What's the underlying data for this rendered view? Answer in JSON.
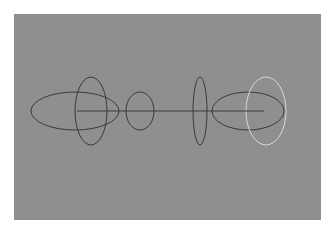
{
  "figure": {
    "background": "#ffffff",
    "panel_color": "#8f8f8f",
    "stroke_dark": "#3a3a3a",
    "stroke_light": "#d8d8d8",
    "axis_line": {
      "x1": 77,
      "x2": 264,
      "y": 111
    },
    "shapes": [
      {
        "name": "large-horizontal-ellipse",
        "cx": 75,
        "cy": 111,
        "rx": 44,
        "ry": 19,
        "tone": "dark"
      },
      {
        "name": "tall-ellipse",
        "cx": 91,
        "cy": 111,
        "rx": 16,
        "ry": 34,
        "tone": "dark"
      },
      {
        "name": "small-ellipse",
        "cx": 140,
        "cy": 111,
        "rx": 14,
        "ry": 19,
        "tone": "dark"
      },
      {
        "name": "thin-vertical-ellipse",
        "cx": 200,
        "cy": 111,
        "rx": 7,
        "ry": 34,
        "tone": "dark"
      },
      {
        "name": "right-horizontal-ellipse",
        "cx": 248,
        "cy": 111,
        "rx": 36,
        "ry": 19,
        "tone": "dark"
      },
      {
        "name": "light-vertical-ellipse",
        "cx": 266,
        "cy": 111,
        "rx": 20,
        "ry": 34,
        "tone": "light"
      }
    ]
  }
}
